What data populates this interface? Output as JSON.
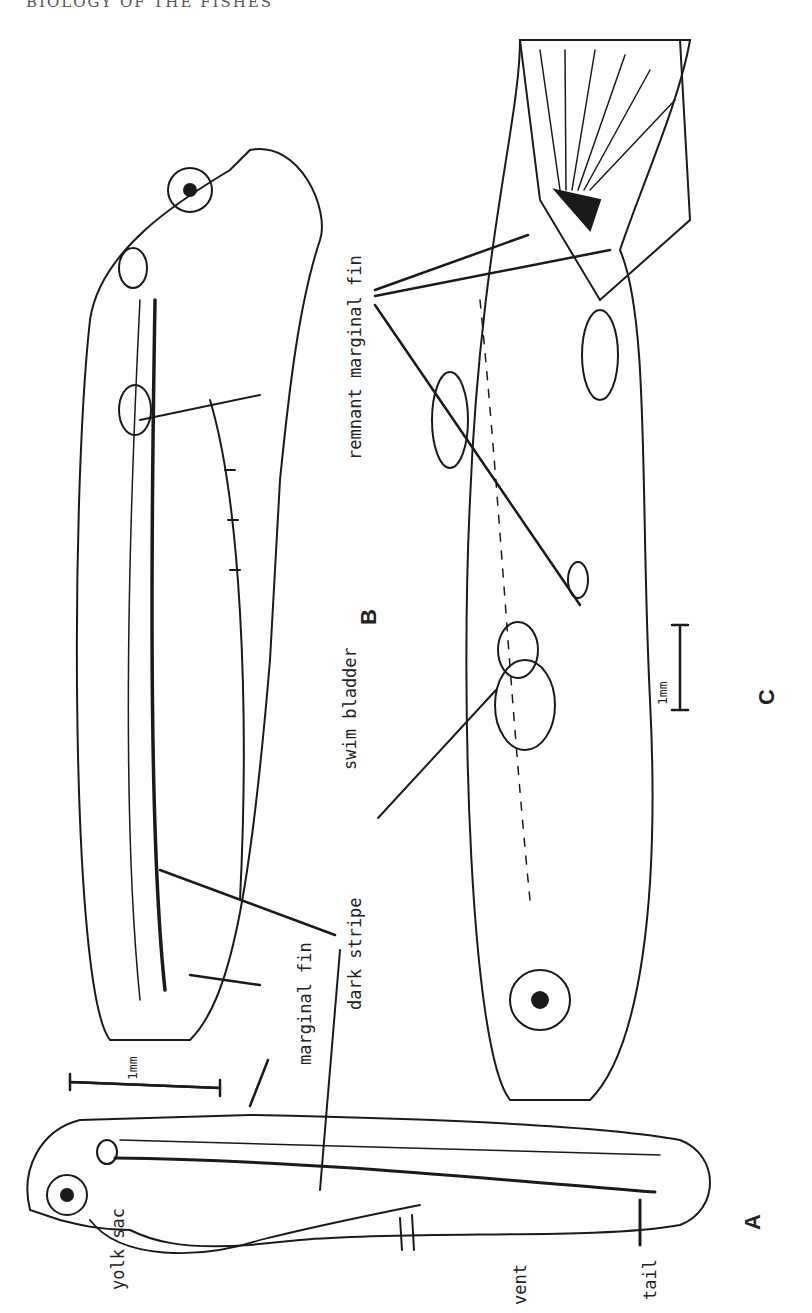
{
  "header": {
    "running_title": "BIOLOGY OF THE FISHES"
  },
  "figure": {
    "orientation": "rotated 90 degrees counter-clockwise",
    "stages": [
      {
        "id": "A",
        "label": "A",
        "description": "newly hatched larva with yolk sac"
      },
      {
        "id": "B",
        "label": "B",
        "description": "older larva with swim bladder"
      },
      {
        "id": "C",
        "label": "C",
        "description": "post-larva / juvenile with developing fins"
      }
    ],
    "labels": {
      "yolk_sac": "yolk sac",
      "vent": "vent",
      "tail": "tail",
      "marginal_fin": "marginal fin",
      "dark_stripe": "dark stripe",
      "swim_bladder": "swim bladder",
      "remnant_marginal_fin": "remnant marginal fin"
    },
    "scale_bars": [
      {
        "stage": "A/B",
        "label": "1mm"
      },
      {
        "stage": "C",
        "label": "1mm"
      }
    ],
    "ink_color": "#1a1a1a",
    "background_color": "#ffffff"
  }
}
